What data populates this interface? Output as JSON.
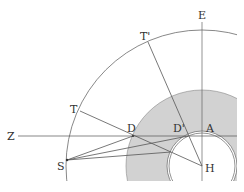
{
  "diagram": {
    "colors": {
      "line": "#555555",
      "shade": "#d2d2d2",
      "background": "#ffffff"
    },
    "center": {
      "x": 202,
      "y": 166
    },
    "radii": {
      "outer_arc": 136,
      "shaded_disk": 76,
      "inner_ring_outer": 35,
      "inner_ring_inner": 33
    },
    "labels": {
      "E": "E",
      "T_prime": "T'",
      "T": "T",
      "Z": "Z",
      "D": "D",
      "D_prime": "D'",
      "A": "A",
      "S": "S",
      "H": "H"
    },
    "points": {
      "E": [
        202,
        22
      ],
      "T_prime": [
        148,
        42
      ],
      "T": [
        80,
        111
      ],
      "Z": [
        18,
        136
      ],
      "D": [
        133,
        136
      ],
      "D_prime": [
        188,
        136
      ],
      "A": [
        202,
        132
      ],
      "S": [
        67,
        160
      ],
      "H": [
        202,
        166
      ]
    }
  }
}
